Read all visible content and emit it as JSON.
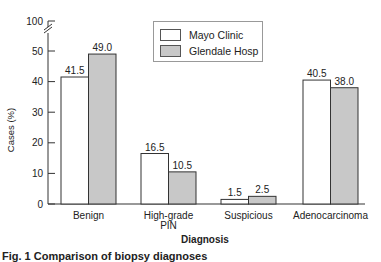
{
  "chart_data": {
    "type": "bar",
    "title": "",
    "xlabel": "Diagnosis",
    "ylabel": "Cases (%)",
    "categories": [
      "Benign",
      "High-grade PIN",
      "Suspicious",
      "Adenocarcinoma"
    ],
    "category_labels": [
      [
        "Benign"
      ],
      [
        "High-grade",
        "PIN"
      ],
      [
        "Suspicious"
      ],
      [
        "Adenocarcinoma"
      ]
    ],
    "series": [
      {
        "name": "Mayo Clinic",
        "values": [
          41.5,
          16.5,
          1.5,
          40.5
        ],
        "labels": [
          "41.5",
          "16.5",
          "1.5",
          "40.5"
        ],
        "color": "#ffffff"
      },
      {
        "name": "Glendale Hosp",
        "values": [
          49.0,
          10.5,
          2.5,
          38.0
        ],
        "labels": [
          "49.0",
          "10.5",
          "2.5",
          "38.0"
        ],
        "color": "#c8c8c8"
      }
    ],
    "yticks": [
      0,
      10,
      20,
      30,
      40,
      50,
      100
    ],
    "ytick_labels": [
      "0",
      "10",
      "20",
      "30",
      "40",
      "50",
      "100"
    ],
    "ylim": [
      0,
      100
    ],
    "axis_break": "between 50 and 100",
    "grid": false,
    "legend_position": "top-center"
  },
  "caption_fragment": "Fig. 1 Comparison of biopsy diagnoses"
}
